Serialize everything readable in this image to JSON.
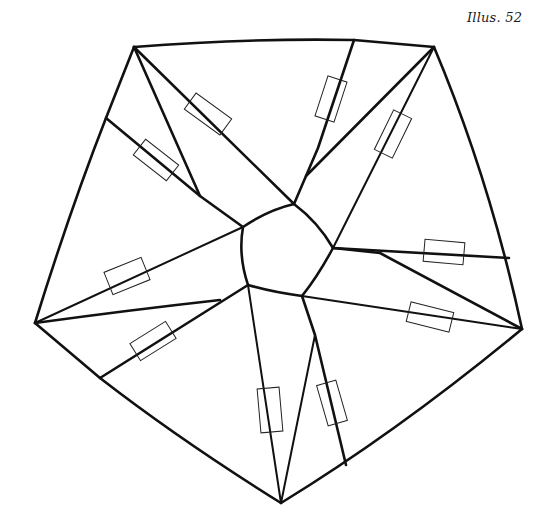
{
  "caption": "Illus. 52",
  "diagram": {
    "colors": {
      "line": "#111111",
      "background": "#ffffff"
    },
    "outer_vertices": [
      [
        134,
        47
      ],
      [
        434,
        47
      ],
      [
        522,
        329
      ],
      [
        281,
        503
      ],
      [
        35,
        323
      ]
    ],
    "center_pentagon": [
      [
        243,
        227
      ],
      [
        294,
        204
      ],
      [
        333,
        248
      ],
      [
        302,
        296
      ],
      [
        248,
        285
      ]
    ],
    "tab_count": 10
  }
}
